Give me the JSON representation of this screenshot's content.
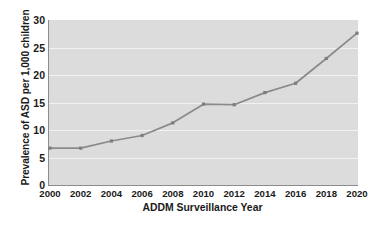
{
  "chart_data": {
    "type": "line",
    "title": "",
    "xlabel": "ADDM Surveillance Year",
    "ylabel": "Prevalence of ASD per 1,000 children",
    "categories": [
      "2000",
      "2002",
      "2004",
      "2006",
      "2008",
      "2010",
      "2012",
      "2014",
      "2016",
      "2018",
      "2020"
    ],
    "x": [
      2000,
      2002,
      2004,
      2006,
      2008,
      2010,
      2012,
      2014,
      2016,
      2018,
      2020
    ],
    "values": [
      6.7,
      6.7,
      8.0,
      9.0,
      11.3,
      14.7,
      14.6,
      16.8,
      18.5,
      23.0,
      27.6
    ],
    "series": [
      {
        "name": "Prevalence of ASD per 1,000 children",
        "values": [
          6.7,
          6.7,
          8.0,
          9.0,
          11.3,
          14.7,
          14.6,
          16.8,
          18.5,
          23.0,
          27.6
        ]
      }
    ],
    "ylim": [
      0,
      30
    ],
    "yticks": [
      0,
      5,
      10,
      15,
      20,
      25,
      30
    ],
    "ytick_labels": [
      "0",
      "5",
      "10",
      "15",
      "20",
      "25",
      "30"
    ],
    "xlim": [
      2000,
      2020
    ],
    "grid": "horizontal",
    "legend": "none",
    "marker": "square",
    "colors": {
      "line": "#8a8a8a",
      "marker": "#7d7d7d",
      "plot_background": "#dcdcdc",
      "gridline": "#f2f2f2",
      "axis": "#8c8c8c",
      "text": "#1a1a1a",
      "page_background": "#ffffff"
    }
  }
}
